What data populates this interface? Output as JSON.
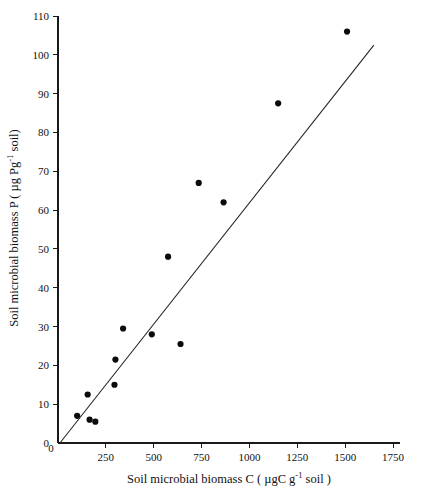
{
  "chart_data": {
    "type": "scatter",
    "title": "",
    "xlabel": "Soil microbial biomass C ( µgC g-1 soil )",
    "ylabel": "Soil microbial biomass P ( µg Pg-1 soil)",
    "xlabel_parts": {
      "pre": "Soil microbial biomass C ( µgC g",
      "sup": "-1",
      "post": " soil )"
    },
    "ylabel_parts": {
      "pre": "Soil microbial biomass P ( µg Pg",
      "sup": "-1",
      "post": " soil)"
    },
    "xlim": [
      0,
      1750
    ],
    "ylim": [
      0,
      110
    ],
    "xticks": [
      0,
      250,
      500,
      750,
      1000,
      1250,
      1500,
      1750
    ],
    "yticks": [
      0,
      10,
      20,
      30,
      40,
      50,
      60,
      70,
      80,
      90,
      100,
      110
    ],
    "xtick_labels": [
      "0",
      "250",
      "500",
      "750",
      "1000",
      "1250",
      "1500",
      "1750"
    ],
    "ytick_labels": [
      "0",
      "10",
      "20",
      "30",
      "40",
      "50",
      "60",
      "70",
      "80",
      "90",
      "100",
      "110"
    ],
    "grid": false,
    "legend": "none",
    "marker_color": "#0b0b0b",
    "line_color": "#222222",
    "axis_color": "#1a1a1a",
    "x": [
      100,
      155,
      165,
      195,
      295,
      300,
      340,
      490,
      575,
      640,
      735,
      865,
      1150,
      1510
    ],
    "y": [
      7.0,
      12.5,
      6.0,
      5.5,
      15.0,
      21.5,
      29.5,
      28.0,
      48.0,
      25.5,
      67.0,
      62.0,
      87.5,
      106.0
    ],
    "points": [
      {
        "x": 100,
        "y": 7.0
      },
      {
        "x": 155,
        "y": 12.5
      },
      {
        "x": 165,
        "y": 6.0
      },
      {
        "x": 195,
        "y": 5.5
      },
      {
        "x": 295,
        "y": 15.0
      },
      {
        "x": 300,
        "y": 21.5
      },
      {
        "x": 340,
        "y": 29.5
      },
      {
        "x": 490,
        "y": 28.0
      },
      {
        "x": 575,
        "y": 48.0
      },
      {
        "x": 640,
        "y": 25.5
      },
      {
        "x": 735,
        "y": 67.0
      },
      {
        "x": 865,
        "y": 62.0
      },
      {
        "x": 1150,
        "y": 87.5
      },
      {
        "x": 1510,
        "y": 106.0
      }
    ],
    "trendline": {
      "type": "linear",
      "x_start": 10,
      "y_start": 0.0,
      "x_end": 1650,
      "y_end": 102.5
    }
  }
}
